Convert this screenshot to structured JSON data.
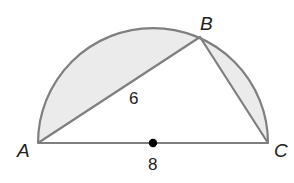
{
  "diagram": {
    "type": "semicircle-inscribed-triangle",
    "points": {
      "A": {
        "label": "A",
        "x": 38,
        "y": 143
      },
      "B": {
        "label": "B",
        "x": 200,
        "y": 37
      },
      "C": {
        "label": "C",
        "x": 268,
        "y": 143
      },
      "center": {
        "x": 153,
        "y": 143
      }
    },
    "measures": {
      "AB": "6",
      "AC": "8"
    },
    "colors": {
      "stroke": "#7f7f7f",
      "fill": "#ebebeb",
      "center_dot": "#000000",
      "text": "#222222"
    }
  }
}
